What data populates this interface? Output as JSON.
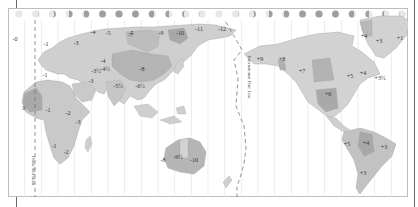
{
  "map": {
    "title": "World Time Zones",
    "colors": {
      "land_light": "#d9d9d9",
      "land_mid": "#c4c4c4",
      "land_dark": "#a9a9a9",
      "meridian": "#e2e2e2",
      "frame": "#bdbdbd",
      "moon": "#9e9e9e"
    },
    "lines": {
      "prime_meridian_label": "Prime Meridian",
      "date_line_label": "International Date Line"
    },
    "moon_phase_count": 24,
    "zones": [
      {
        "label": "-0",
        "x": 7,
        "y": 33
      },
      {
        "label": "-1",
        "x": 38,
        "y": 38
      },
      {
        "label": "-3",
        "x": 68,
        "y": 37
      },
      {
        "label": "-4",
        "x": 85,
        "y": 26
      },
      {
        "label": "-5",
        "x": 100,
        "y": 27
      },
      {
        "label": "-5",
        "x": 123,
        "y": 27
      },
      {
        "label": "-7",
        "x": 122,
        "y": 29
      },
      {
        "label": "-9",
        "x": 153,
        "y": 27
      },
      {
        "label": "-10",
        "x": 172,
        "y": 27
      },
      {
        "label": "-11",
        "x": 191,
        "y": 23
      },
      {
        "label": "-12",
        "x": 214,
        "y": 23
      },
      {
        "label": "-1",
        "x": 37,
        "y": 69
      },
      {
        "label": "-4",
        "x": 95,
        "y": 55
      },
      {
        "label": "-8",
        "x": 134,
        "y": 63
      },
      {
        "label": "-3",
        "x": 83,
        "y": 75
      },
      {
        "label": "-3½",
        "x": 88,
        "y": 65
      },
      {
        "label": "-4½",
        "x": 97,
        "y": 63
      },
      {
        "label": "-5½",
        "x": 110,
        "y": 80
      },
      {
        "label": "-6½",
        "x": 132,
        "y": 80
      },
      {
        "label": "0",
        "x": 16,
        "y": 102
      },
      {
        "label": "-1",
        "x": 40,
        "y": 104
      },
      {
        "label": "-2",
        "x": 60,
        "y": 107
      },
      {
        "label": "-3",
        "x": 70,
        "y": 116
      },
      {
        "label": "-1",
        "x": 46,
        "y": 140
      },
      {
        "label": "-2",
        "x": 58,
        "y": 146
      },
      {
        "label": "-8",
        "x": 155,
        "y": 154
      },
      {
        "label": "-9½",
        "x": 170,
        "y": 151
      },
      {
        "label": "-10",
        "x": 186,
        "y": 154
      },
      {
        "label": "+9",
        "x": 252,
        "y": 53
      },
      {
        "label": "+8",
        "x": 274,
        "y": 53
      },
      {
        "label": "+7",
        "x": 294,
        "y": 65
      },
      {
        "label": "+6",
        "x": 320,
        "y": 88
      },
      {
        "label": "+5",
        "x": 342,
        "y": 70
      },
      {
        "label": "+4",
        "x": 355,
        "y": 67
      },
      {
        "label": "+3½",
        "x": 372,
        "y": 72
      },
      {
        "label": "+4",
        "x": 356,
        "y": 30
      },
      {
        "label": "+3",
        "x": 371,
        "y": 35
      },
      {
        "label": "+1",
        "x": 392,
        "y": 32
      },
      {
        "label": "+5",
        "x": 339,
        "y": 138
      },
      {
        "label": "+4",
        "x": 358,
        "y": 137
      },
      {
        "label": "+3",
        "x": 376,
        "y": 141
      },
      {
        "label": "+3",
        "x": 355,
        "y": 167
      }
    ]
  }
}
